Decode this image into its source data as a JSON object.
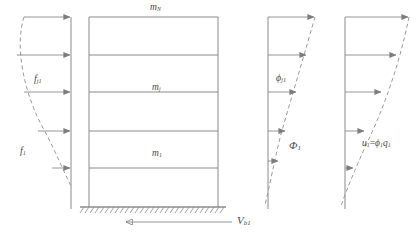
{
  "figure": {
    "stroke_color": "#8a8a8a",
    "text_color": "#4a4a4a",
    "dash_color": "#9a9a9a",
    "background": "#ffffff",
    "width": 418,
    "height": 235
  },
  "panels": {
    "forces": {
      "name": "lateral-force-distribution",
      "labels": {
        "story_force": "f",
        "story_force_sub": "j1",
        "total_force": "f",
        "total_force_sub": "1"
      }
    },
    "frame": {
      "name": "multistory-frame",
      "masses": [
        {
          "symbol": "m",
          "sub": "N"
        },
        {
          "symbol": "m",
          "sub": "j"
        },
        {
          "symbol": "m",
          "sub": "1"
        }
      ],
      "base_shear": {
        "symbol": "V",
        "sub": "b1"
      },
      "stories": 5
    },
    "mode_shape": {
      "name": "mode-shape-distribution",
      "labels": {
        "story_mode": "ϕ",
        "story_mode_sub": "j1",
        "mode_vector": "Φ",
        "mode_vector_sub": "1"
      }
    },
    "displacement": {
      "name": "displacement-distribution",
      "labels": {
        "equation_u": "u",
        "equation_u_sub": "1",
        "equation_eq": "=",
        "equation_phi": "ϕ",
        "equation_phi_sub": "1",
        "equation_q": "q",
        "equation_q_sub": "1"
      }
    }
  }
}
